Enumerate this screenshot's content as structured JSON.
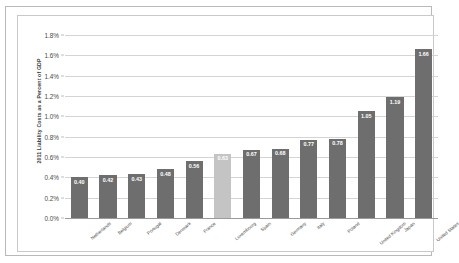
{
  "chart_data": {
    "type": "bar",
    "title": "",
    "xlabel": "",
    "ylabel": "2011 Liability Costs as a Percent of GDP",
    "ylim": [
      0.0,
      1.8
    ],
    "ytick_labels": [
      "1.8%",
      "1.6%",
      "1.4%",
      "1.2%",
      "1.0%",
      "0.8%",
      "0.6%",
      "0.4%",
      "0.2%",
      "0.0%"
    ],
    "ytick_values": [
      1.8,
      1.6,
      1.4,
      1.2,
      1.0,
      0.8,
      0.6,
      0.4,
      0.2,
      0.0
    ],
    "grid": true,
    "legend": "none",
    "categories": [
      "Netherlands",
      "Belgium",
      "Portugal",
      "Denmark",
      "France",
      "Luxembourg",
      "Spain",
      "Germany",
      "Italy",
      "Poland",
      "United Kingdom",
      "Japan",
      "United States"
    ],
    "values": [
      0.4,
      0.42,
      0.43,
      0.48,
      0.56,
      0.63,
      0.67,
      0.68,
      0.77,
      0.78,
      1.05,
      1.19,
      1.66
    ],
    "value_labels": [
      "0.40",
      "0.42",
      "0.43",
      "0.48",
      "0.56",
      "0.63",
      "0.67",
      "0.68",
      "0.77",
      "0.78",
      "1.05",
      "1.19",
      "1.66"
    ],
    "highlighted_index": 5,
    "colors": {
      "bar": "#6e6e6e",
      "bar_highlight": "#c4c4c4",
      "gridline": "#d4d4d4",
      "axis": "#9a9a9a",
      "text": "#4a4a4a",
      "value_label": "#ffffff",
      "background": "#ffffff",
      "frame": "#b9b9b9"
    }
  }
}
